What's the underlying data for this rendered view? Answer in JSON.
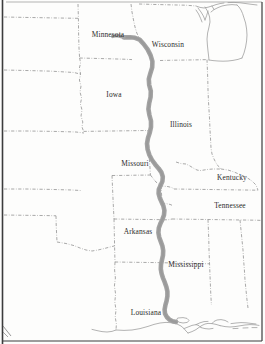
{
  "map": {
    "title": "Mississippi River Basin States",
    "width": 265,
    "height": 344,
    "background_color": "#fdfdfc",
    "frame_color": "#3c3c3c",
    "boundary_color": "#8c8c8c",
    "coastline_color": "#9a9a9a",
    "river_color": "#a0a0a0",
    "river_name": "Mississippi River",
    "label_color": "#2b2b2b"
  },
  "labels": [
    {
      "name": "Minnesota",
      "text": "Minnesota",
      "x": 108,
      "y": 34
    },
    {
      "name": "Wisconsin",
      "text": "Wisconsin",
      "x": 168,
      "y": 44
    },
    {
      "name": "Iowa",
      "text": "Iowa",
      "x": 114,
      "y": 94
    },
    {
      "name": "Illinois",
      "text": "Illinois",
      "x": 181,
      "y": 124
    },
    {
      "name": "Missouri",
      "text": "Missouri",
      "x": 135,
      "y": 163
    },
    {
      "name": "Kentucky",
      "text": "Kentucky",
      "x": 232,
      "y": 177
    },
    {
      "name": "Tennessee",
      "text": "Tennessee",
      "x": 230,
      "y": 205
    },
    {
      "name": "Arkansas",
      "text": "Arkansas",
      "x": 138,
      "y": 231
    },
    {
      "name": "Mississippi",
      "text": "Mississippi",
      "x": 186,
      "y": 264
    },
    {
      "name": "Louisiana",
      "text": "Louisiana",
      "x": 146,
      "y": 312
    }
  ]
}
